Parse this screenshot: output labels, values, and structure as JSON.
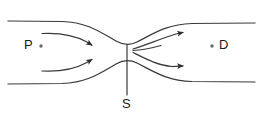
{
  "diagram": {
    "type": "fluid-flow-nozzle-schematic",
    "background_color": "#ffffff",
    "stroke_color": "#3a3a3a",
    "label_color": "#1a1a1a",
    "width": 262,
    "height": 115,
    "labels": {
      "upstream": "P",
      "downstream": "D",
      "throat": "S"
    },
    "markers": {
      "upstream_point": "point-marker-dot",
      "downstream_point": "point-marker-dot"
    },
    "walls": {
      "top_wall": "converging-diverging-upper-wall",
      "bottom_wall": "converging-diverging-lower-wall"
    },
    "throat_line": {
      "name": "throat-section-line",
      "x": 127,
      "y_top": 45,
      "y_bottom": 95
    },
    "streamlines": {
      "upstream_count": 2,
      "downstream_count": 3,
      "upstream_arrows": 2,
      "downstream_arrows": 2,
      "direction": "left-to-right"
    }
  }
}
